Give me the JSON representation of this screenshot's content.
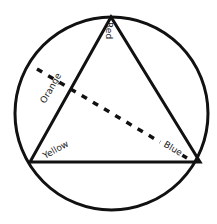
{
  "diagram": {
    "title": "",
    "stroke_color": "#111111",
    "background": "#ffffff",
    "circle": {
      "cx": 111.5,
      "cy": 113.5,
      "r": 96.5,
      "stroke_width": 3
    },
    "triangle": {
      "points": [
        [
          111,
          17
        ],
        [
          30,
          162
        ],
        [
          200,
          162
        ]
      ],
      "stroke_width": 3
    },
    "dashed_line": {
      "from": [
        37,
        69
      ],
      "to": [
        187,
        158
      ],
      "stroke_width": 3.5,
      "dash": "6 7"
    },
    "labels": {
      "red": "Red",
      "orange": "Orange",
      "yellow": "Yellow",
      "blue": "Blue"
    }
  }
}
